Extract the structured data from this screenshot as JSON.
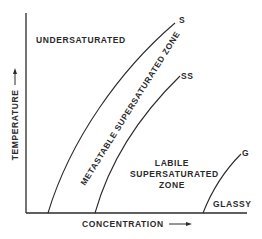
{
  "diagram": {
    "type": "phase-diagram",
    "axes": {
      "x_label": "CONCENTRATION",
      "y_label": "TEMPERATURE",
      "x_arrow": "arrow-right",
      "y_arrow": "arrow-up"
    },
    "curves": [
      {
        "id": "S",
        "label": "S"
      },
      {
        "id": "SS",
        "label": "SS"
      },
      {
        "id": "G",
        "label": "G"
      }
    ],
    "regions": {
      "undersaturated": "UNDERSATURATED",
      "metastable": "METASTABLE SUPERSATURATED ZONE",
      "labile_line1": "LABILE",
      "labile_line2": "SUPERSATURATED",
      "labile_line3": "ZONE",
      "glassy": "GLASSY"
    },
    "colors": {
      "ink": "#2a2a2a",
      "background": "#ffffff"
    }
  }
}
